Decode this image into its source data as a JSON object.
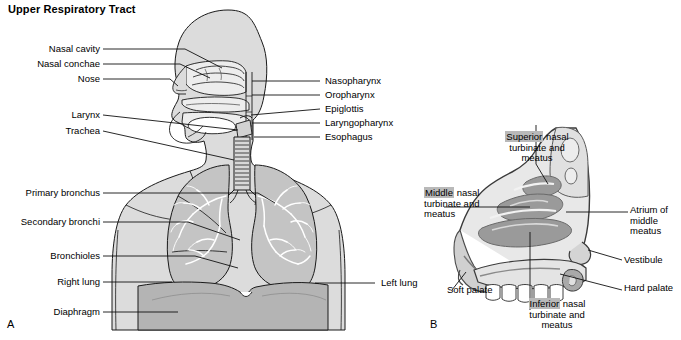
{
  "figure": {
    "title": "Upper Respiratory Tract",
    "background_color": "#ffffff",
    "panels": [
      {
        "letter": "A",
        "name": "full-respiratory-tract-anterior-view"
      },
      {
        "letter": "B",
        "name": "nasal-cavity-sagittal-section"
      }
    ]
  },
  "colors": {
    "outline": "#1a1a1a",
    "body_fill": "#dcdcdc",
    "lung_fill": "#c4c4c4",
    "diaphragm_fill": "#b4b4b4",
    "cavity_fill": "#ededed",
    "mucosa_gray": "#8e8e8e",
    "highlight": "#b9b9b9",
    "leader_line": "#111111"
  },
  "panel_a": {
    "letter": "A",
    "labels_left": [
      {
        "text": "Nasal cavity"
      },
      {
        "text": "Nasal conchae"
      },
      {
        "text": "Nose"
      },
      {
        "text": "Larynx"
      },
      {
        "text": "Trachea"
      },
      {
        "text": "Primary bronchus"
      },
      {
        "text": "Secondary bronchi"
      },
      {
        "text": "Bronchioles"
      },
      {
        "text": "Right lung"
      },
      {
        "text": "Diaphragm"
      }
    ],
    "labels_right": [
      {
        "text": "Nasopharynx"
      },
      {
        "text": "Oropharynx"
      },
      {
        "text": "Epiglottis"
      },
      {
        "text": "Laryngopharynx"
      },
      {
        "text": "Esophagus"
      },
      {
        "text": "Left lung"
      }
    ]
  },
  "panel_b": {
    "letter": "B",
    "labels": [
      {
        "name": "superior-nasal-turbinate-label",
        "highlight_word": "Superior",
        "rest_line1": " nasal",
        "line2": "turbinate and",
        "line3": "meatus"
      },
      {
        "name": "middle-nasal-turbinate-label",
        "highlight_word": "Middle",
        "rest_line1": " nasal",
        "line2": "turbinate and",
        "line3": "meatus"
      },
      {
        "name": "inferior-nasal-turbinate-label",
        "highlight_word": "Inferior",
        "rest_line1": " nasal",
        "line2": "turbinate and",
        "line3": "meatus"
      }
    ],
    "labels_right": [
      {
        "text_line1": "Atrium of",
        "text_line2": "middle",
        "text_line3": "meatus"
      },
      {
        "text_line1": "Vestibule"
      },
      {
        "text_line1": "Hard palate"
      }
    ],
    "labels_left": [
      {
        "text": "Soft palate"
      }
    ]
  }
}
